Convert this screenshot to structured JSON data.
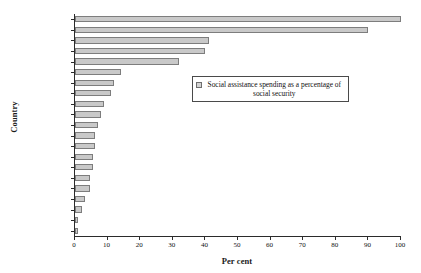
{
  "chart_data": {
    "type": "bar",
    "orientation": "horizontal",
    "title": "",
    "xlabel": "Per cent",
    "ylabel": "Country",
    "xlim": [
      0,
      100
    ],
    "xticks": [
      0,
      10,
      20,
      30,
      40,
      50,
      60,
      70,
      80,
      90,
      100
    ],
    "grid": false,
    "legend_position": "inside-upper-right",
    "legend": [
      "Social assistance spending as a percentage of social security"
    ],
    "series": [
      {
        "name": "Social assistance spending as a percentage of social security",
        "values": [
          100,
          90,
          41,
          40,
          32,
          14,
          12,
          11,
          9,
          8,
          7,
          6,
          6,
          5.5,
          5.5,
          4.5,
          4.5,
          3,
          2,
          1,
          0.8
        ]
      }
    ],
    "categories": [
      "New Zealand",
      "Australia",
      "Ireland",
      "USA",
      "UK",
      "Canada",
      "Germany",
      "Netherlands",
      "Italy",
      "Spain",
      "Sweden",
      "France",
      "Switzerland",
      "Norway",
      "Austria",
      "Portugal",
      "Japan",
      "Belgium",
      "Finland",
      "Iceland",
      "Greece"
    ],
    "colors": {
      "bar_fill": "#c9c9c9",
      "bar_border": "#7d7d7d",
      "axis": "#2b2b2b",
      "text": "#111111",
      "background": "#ffffff"
    }
  },
  "legend": {
    "label": "Social assistance spending as a percentage of social security"
  },
  "axes": {
    "x_title": "Per cent",
    "y_title": "Country"
  }
}
